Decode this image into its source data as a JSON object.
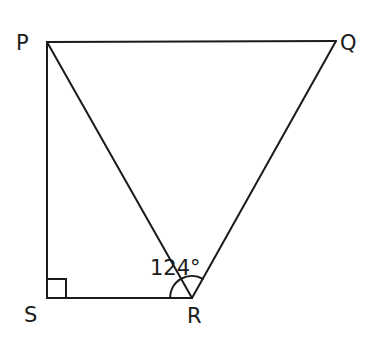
{
  "diagram": {
    "type": "geometry",
    "vertices": {
      "P": {
        "label": "P",
        "x": 47,
        "y": 42
      },
      "Q": {
        "label": "Q",
        "x": 336,
        "y": 41
      },
      "R": {
        "label": "R",
        "x": 192,
        "y": 298
      },
      "S": {
        "label": "S",
        "x": 47,
        "y": 298
      }
    },
    "segments": [
      "PQ",
      "QR",
      "RS",
      "SP",
      "PR"
    ],
    "right_angle": {
      "vertex": "S",
      "size": 19
    },
    "angle_mark": {
      "vertex": "R",
      "between": [
        "RS",
        "RQ"
      ],
      "value_label": "124°",
      "radius": 22
    },
    "stroke_color": "#1a1a1a",
    "background": "#ffffff"
  }
}
